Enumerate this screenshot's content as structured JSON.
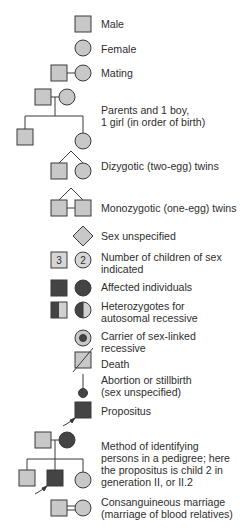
{
  "colors": {
    "fill_unaffected": "#c8c8c8",
    "fill_affected": "#444444",
    "stroke": "#3a3a3a",
    "text": "#2e2e2e"
  },
  "legend": [
    {
      "id": "male",
      "label": "Male"
    },
    {
      "id": "female",
      "label": "Female"
    },
    {
      "id": "mating",
      "label": "Mating"
    },
    {
      "id": "parents_children",
      "label_lines": [
        "Parents and 1 boy,",
        "1 girl (in order of birth)"
      ]
    },
    {
      "id": "dizygotic",
      "label": "Dizygotic (two-egg) twins"
    },
    {
      "id": "monozygotic",
      "label": "Monozygotic (one-egg) twins"
    },
    {
      "id": "sex_unspecified",
      "label": "Sex unspecified"
    },
    {
      "id": "number_children",
      "label_lines": [
        "Number of children of sex",
        "indicated"
      ],
      "male_count": "3",
      "female_count": "2"
    },
    {
      "id": "affected",
      "label": "Affected individuals"
    },
    {
      "id": "heterozygotes",
      "label_lines": [
        "Heterozygotes for",
        "autosomal recessive"
      ]
    },
    {
      "id": "carrier",
      "label_lines": [
        "Carrier of sex-linked",
        "recessive"
      ]
    },
    {
      "id": "death",
      "label": "Death"
    },
    {
      "id": "abortion",
      "label_lines": [
        "Abortion or stillbirth",
        "(sex unspecified)"
      ]
    },
    {
      "id": "propositus",
      "label": "Propositus"
    },
    {
      "id": "method",
      "label_lines": [
        "Method of identifying",
        "persons in a pedigree; here",
        "the propositus is child 2 in",
        "generation II, or II.2"
      ]
    },
    {
      "id": "consanguineous",
      "label_lines": [
        "Consanguineous marriage",
        "(marriage of blood relatives)"
      ]
    }
  ]
}
